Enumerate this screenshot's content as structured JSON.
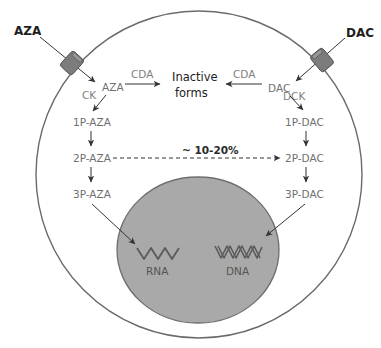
{
  "diagram": {
    "colors": {
      "membrane": "#6a6a6a",
      "nucleus_fill": "#a9a9a9",
      "nucleus_stroke": "#6e6e6e",
      "transporter_fill": "#7c7c7c",
      "text_primary": "#2b2b2b",
      "text_secondary": "#6f6f6f",
      "arrow": "#333333"
    },
    "external": {
      "left_drug": "AZA",
      "right_drug": "DAC"
    },
    "left_pathway": {
      "drug": "AZA",
      "kinase": "CK",
      "deaminase": "CDA",
      "steps": [
        "1P-AZA",
        "2P-AZA",
        "3P-AZA"
      ]
    },
    "right_pathway": {
      "drug": "DAC",
      "kinase": "DCK",
      "deaminase": "CDA",
      "steps": [
        "1P-DAC",
        "2P-DAC",
        "3P-DAC"
      ]
    },
    "center": {
      "inactive_line1": "Inactive",
      "inactive_line2": "forms",
      "conversion_label": "~ 10-20%"
    },
    "nucleus": {
      "rna_label": "RNA",
      "dna_label": "DNA"
    }
  }
}
